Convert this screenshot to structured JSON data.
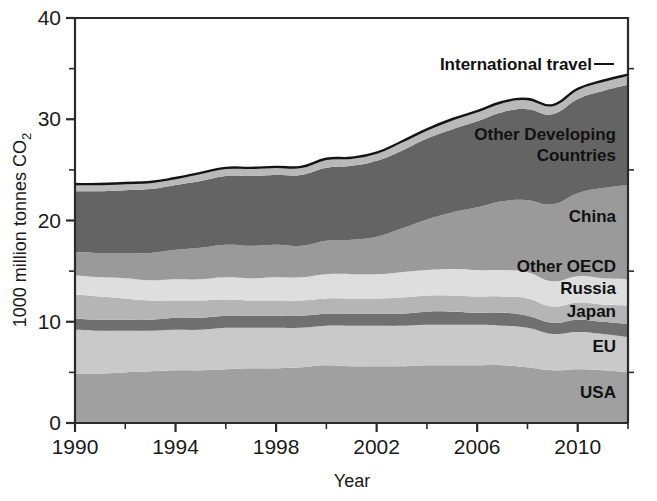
{
  "chart_data": {
    "type": "area",
    "stacked": true,
    "title": "",
    "xlabel": "Year",
    "ylabel": "1000 million tonnes CO2",
    "ylabel_display": "1000 million tonnes CO",
    "ylabel_subscript": "2",
    "xlim": [
      1990,
      2012
    ],
    "ylim": [
      0,
      40
    ],
    "grid": false,
    "legend_position": "inline-right",
    "x_ticks_major": [
      1990,
      1994,
      1998,
      2002,
      2006,
      2010
    ],
    "x_ticks_major_labels": [
      "1990",
      "1994",
      "1998",
      "2002",
      "2006",
      "2010"
    ],
    "x_ticks_minor": [
      1992,
      1996,
      2000,
      2004,
      2008,
      2012
    ],
    "y_ticks_major": [
      0,
      10,
      20,
      30,
      40
    ],
    "y_ticks_major_labels": [
      "0",
      "10",
      "20",
      "30",
      "40"
    ],
    "y_ticks_minor": [
      5,
      15,
      25,
      35
    ],
    "x": [
      1990,
      1991,
      1992,
      1993,
      1994,
      1995,
      1996,
      1997,
      1998,
      1999,
      2000,
      2001,
      2002,
      2003,
      2004,
      2005,
      2006,
      2007,
      2008,
      2009,
      2010,
      2011,
      2012
    ],
    "series": [
      {
        "name": "USA",
        "label": "USA",
        "color": "#a0a0a0",
        "values": [
          4.9,
          4.9,
          5.0,
          5.1,
          5.2,
          5.2,
          5.3,
          5.4,
          5.4,
          5.5,
          5.7,
          5.6,
          5.6,
          5.6,
          5.7,
          5.7,
          5.7,
          5.7,
          5.5,
          5.2,
          5.3,
          5.2,
          5.0
        ]
      },
      {
        "name": "EU",
        "label": "EU",
        "color": "#c9c9c9",
        "values": [
          4.3,
          4.2,
          4.1,
          4.0,
          4.0,
          4.0,
          4.1,
          4.0,
          4.0,
          3.9,
          3.9,
          4.0,
          4.0,
          4.0,
          4.0,
          4.0,
          4.0,
          3.9,
          3.9,
          3.6,
          3.7,
          3.6,
          3.5
        ]
      },
      {
        "name": "Japan",
        "label": "Japan",
        "color": "#707070",
        "values": [
          1.1,
          1.1,
          1.1,
          1.1,
          1.2,
          1.2,
          1.2,
          1.2,
          1.2,
          1.2,
          1.2,
          1.2,
          1.2,
          1.2,
          1.3,
          1.3,
          1.2,
          1.3,
          1.2,
          1.1,
          1.2,
          1.2,
          1.3
        ]
      },
      {
        "name": "Russia",
        "label": "Russia",
        "color": "#b5b5b5",
        "values": [
          2.4,
          2.3,
          2.1,
          1.9,
          1.7,
          1.7,
          1.6,
          1.5,
          1.5,
          1.5,
          1.5,
          1.5,
          1.5,
          1.6,
          1.6,
          1.6,
          1.6,
          1.6,
          1.7,
          1.6,
          1.7,
          1.7,
          1.8
        ]
      },
      {
        "name": "Other OECD",
        "label": "Other OECD",
        "color": "#dedede",
        "values": [
          1.9,
          1.9,
          2.0,
          2.0,
          2.1,
          2.1,
          2.2,
          2.2,
          2.3,
          2.3,
          2.4,
          2.4,
          2.4,
          2.5,
          2.5,
          2.6,
          2.6,
          2.6,
          2.6,
          2.5,
          2.6,
          2.6,
          2.6
        ]
      },
      {
        "name": "China",
        "label": "China",
        "color": "#9a9a9a",
        "values": [
          2.3,
          2.4,
          2.5,
          2.7,
          2.9,
          3.1,
          3.2,
          3.2,
          3.2,
          3.1,
          3.3,
          3.4,
          3.7,
          4.3,
          5.0,
          5.6,
          6.2,
          6.8,
          7.1,
          7.6,
          8.2,
          8.9,
          9.3
        ]
      },
      {
        "name": "Other Developing Countries",
        "label": "Other Developing\nCountries",
        "color": "#646464",
        "values": [
          6.0,
          6.1,
          6.2,
          6.3,
          6.4,
          6.6,
          6.8,
          6.9,
          6.9,
          7.0,
          7.2,
          7.3,
          7.5,
          7.7,
          8.0,
          8.2,
          8.5,
          8.8,
          9.0,
          8.9,
          9.3,
          9.6,
          9.9
        ]
      },
      {
        "name": "International travel",
        "label": "International travel",
        "color": "#b9b9b9",
        "values": [
          0.7,
          0.7,
          0.7,
          0.7,
          0.7,
          0.8,
          0.8,
          0.8,
          0.8,
          0.8,
          0.9,
          0.8,
          0.8,
          0.9,
          0.9,
          1.0,
          1.0,
          1.0,
          1.0,
          0.9,
          1.0,
          1.0,
          1.0
        ]
      }
    ],
    "annotations": [
      {
        "name": "international-travel",
        "text": "International travel",
        "has_leader_line": true
      },
      {
        "name": "other-developing-countries",
        "text": "Other Developing Countries",
        "has_leader_line": false
      },
      {
        "name": "china",
        "text": "China",
        "has_leader_line": false
      },
      {
        "name": "other-oecd",
        "text": "Other OECD",
        "has_leader_line": false
      },
      {
        "name": "russia",
        "text": "Russia",
        "has_leader_line": false
      },
      {
        "name": "japan",
        "text": "Japan",
        "has_leader_line": false
      },
      {
        "name": "eu",
        "text": "EU",
        "has_leader_line": false
      },
      {
        "name": "usa",
        "text": "USA",
        "has_leader_line": false
      }
    ]
  }
}
